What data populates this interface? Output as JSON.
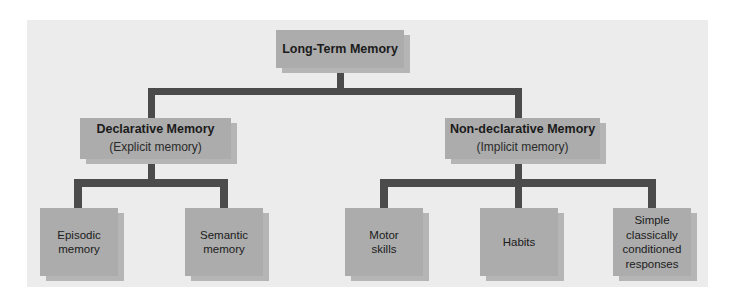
{
  "diagram": {
    "type": "hierarchy",
    "root": {
      "label": "Long-Term Memory"
    },
    "branches": [
      {
        "label": "Declarative Memory",
        "sublabel": "(Explicit memory)",
        "children": [
          {
            "label": "Episodic\nmemory"
          },
          {
            "label": "Semantic\nmemory"
          }
        ]
      },
      {
        "label": "Non-declarative Memory",
        "sublabel": "(Implicit memory)",
        "children": [
          {
            "label": "Motor\nskills"
          },
          {
            "label": "Habits"
          },
          {
            "label": "Simple\nclassically\nconditioned\nresponses"
          }
        ]
      }
    ]
  },
  "colors": {
    "panel": "#ececec",
    "box": "#acacac",
    "box_shadow": "#b5b5b5",
    "connector": "#4b4b4b",
    "text": "#1b1b1b"
  }
}
